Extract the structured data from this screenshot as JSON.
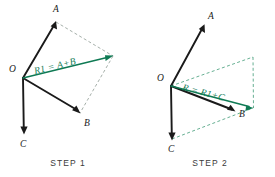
{
  "figure": {
    "background_color": "#ffffff",
    "vector_color": "#1a1a1a",
    "resultant_color": "#0f7a54",
    "construction_color": "#8e9a93",
    "panels": [
      {
        "id": "step-1",
        "caption": "STEP 1",
        "origin_label": "O",
        "resultant_label": "R1 = A+B",
        "vectors": [
          {
            "label": "A",
            "origin": [
              23,
              78
            ],
            "tip": [
              56,
              22
            ]
          },
          {
            "label": "B",
            "origin": [
              23,
              78
            ],
            "tip": [
              80,
              113
            ]
          },
          {
            "label": "C",
            "origin": [
              23,
              78
            ],
            "tip": [
              24,
              133
            ]
          }
        ],
        "resultant": {
          "label": "R1",
          "origin": [
            23,
            78
          ],
          "tip": [
            113,
            56
          ]
        },
        "construction_lines": [
          {
            "from": [
              56,
              22
            ],
            "to": [
              113,
              56
            ]
          },
          {
            "from": [
              113,
              56
            ],
            "to": [
              80,
              113
            ]
          }
        ]
      },
      {
        "id": "step-2",
        "caption": "STEP 2",
        "origin_label": "O",
        "resultant_label": "R = R1+C",
        "vectors": [
          {
            "label": "A",
            "origin": [
              171,
              86
            ],
            "tip": [
              204,
              25
            ]
          },
          {
            "label": "B",
            "origin": [
              171,
              86
            ],
            "tip": [
              235,
              112
            ]
          },
          {
            "label": "C",
            "origin": [
              171,
              86
            ],
            "tip": [
              172,
              139
            ]
          }
        ],
        "resultant": {
          "label": "R",
          "origin": [
            171,
            86
          ],
          "tip": [
            253,
            108
          ]
        },
        "construction_lines": [
          {
            "from": [
              171,
              86
            ],
            "to": [
              253,
              57
            ]
          },
          {
            "from": [
              253,
              57
            ],
            "to": [
              253,
              108
            ]
          },
          {
            "from": [
              172,
              139
            ],
            "to": [
              253,
              108
            ]
          }
        ]
      }
    ]
  }
}
